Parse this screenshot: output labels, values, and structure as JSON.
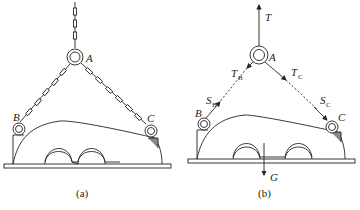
{
  "figure_a": {
    "caption": "(a)",
    "points": {
      "A": "A",
      "B": "B",
      "C": "C"
    }
  },
  "figure_b": {
    "caption": "(b)",
    "points": {
      "A": "A",
      "B": "B",
      "C": "C"
    },
    "forces": {
      "T": "T",
      "TB": "T",
      "TB_sub": "B",
      "TC": "T",
      "TC_sub": "C",
      "SB": "S",
      "SB_sub": "B",
      "SC": "S",
      "SC_sub": "C",
      "G": "G"
    }
  }
}
